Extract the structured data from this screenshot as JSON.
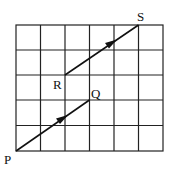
{
  "diagram": {
    "type": "grid-vectors",
    "grid": {
      "columns": 6,
      "rows": 5
    },
    "points": {
      "P": {
        "label": "P",
        "grid": [
          0,
          0
        ]
      },
      "Q": {
        "label": "Q",
        "grid": [
          3,
          2
        ]
      },
      "R": {
        "label": "R",
        "grid": [
          2,
          3
        ]
      },
      "S": {
        "label": "S",
        "grid": [
          5,
          5
        ]
      }
    },
    "vectors": [
      {
        "from": "P",
        "to": "Q",
        "arrow": "mid"
      },
      {
        "from": "R",
        "to": "S",
        "arrow": "mid"
      }
    ],
    "labels": {
      "P": "P",
      "Q": "Q",
      "R": "R",
      "S": "S"
    },
    "colors": {
      "line": "#111111",
      "background": "#ffffff"
    }
  }
}
